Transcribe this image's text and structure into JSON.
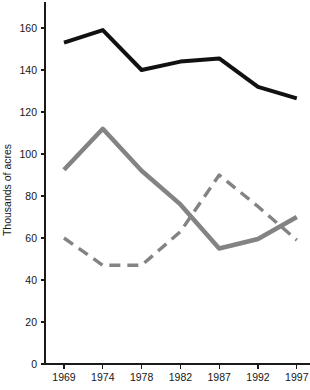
{
  "chart_data": {
    "type": "line",
    "title": "",
    "xlabel": "",
    "ylabel": "Thousands of acres",
    "x": [
      1969,
      1974,
      1978,
      1982,
      1987,
      1992,
      1997
    ],
    "xtick_labels": [
      "1969",
      "1974",
      "1978",
      "1982",
      "1987",
      "1992",
      "1997"
    ],
    "ytick_labels": [
      "0",
      "20",
      "40",
      "60",
      "80",
      "100",
      "120",
      "140",
      "160"
    ],
    "yticks": [
      0,
      20,
      40,
      60,
      80,
      100,
      120,
      140,
      160
    ],
    "ylim": [
      0,
      170
    ],
    "grid": false,
    "legend": "none",
    "series": [
      {
        "name": "black-solid-series",
        "style": "solid",
        "color": "#111111",
        "width": 4,
        "values": [
          153,
          159,
          140,
          144,
          145.5,
          132,
          126.5
        ]
      },
      {
        "name": "gray-solid-series",
        "style": "solid",
        "color": "#838383",
        "width": 4.5,
        "values": [
          92.5,
          112,
          92,
          76,
          55,
          59.5,
          70
        ]
      },
      {
        "name": "gray-dashed-series",
        "style": "dashed",
        "color": "#838383",
        "width": 3.4,
        "values": [
          60,
          47,
          47,
          63,
          90,
          75,
          59
        ]
      }
    ]
  },
  "axis": {
    "y_title": "Thousands of acres"
  }
}
